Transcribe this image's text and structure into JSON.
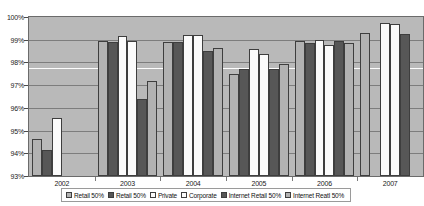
{
  "chart_data": {
    "type": "bar",
    "title": "",
    "xlabel": "",
    "ylabel": "",
    "categories": [
      "2002",
      "2003",
      "2004",
      "2005",
      "2006",
      "2007"
    ],
    "ylim": [
      93,
      100
    ],
    "ytick_labels": [
      "100%",
      "99%",
      "98%",
      "97%",
      "96%",
      "95%",
      "94%",
      "93%"
    ],
    "ytick_values": [
      100,
      99,
      98,
      97,
      96,
      95,
      94,
      93
    ],
    "grid": true,
    "legend_position": "bottom",
    "series": [
      {
        "name": "Retail 50%",
        "fill": "lightgray",
        "values": [
          94.65,
          98.95,
          98.9,
          97.5,
          98.95,
          99.3
        ]
      },
      {
        "name": "Retail 50%",
        "fill": "darkgray",
        "values": [
          94.15,
          98.9,
          98.9,
          97.7,
          98.85,
          null
        ]
      },
      {
        "name": "Private",
        "fill": "white",
        "values": [
          95.55,
          99.15,
          99.2,
          98.6,
          99.0,
          99.75
        ]
      },
      {
        "name": "Corporate",
        "fill": "white",
        "values": [
          null,
          98.95,
          99.2,
          98.35,
          98.75,
          99.7
        ]
      },
      {
        "name": "Internet Retail 50%",
        "fill": "darkgray",
        "values": [
          null,
          96.4,
          98.5,
          97.7,
          98.95,
          99.25
        ]
      },
      {
        "name": "Internet Reatl 50%",
        "fill": "lightgray",
        "values": [
          null,
          97.2,
          98.65,
          97.95,
          98.85,
          null
        ]
      }
    ],
    "colors": {
      "lightgray": "#b2b2b2",
      "darkgray": "#575757",
      "white": "#fbfbfb",
      "plot_background": "#b9b9b9",
      "gridline": "#7d7d7d",
      "trendline": "#fdfdfd",
      "bar_border": "#3e3e3e"
    },
    "annotations": [
      {
        "name": "trend-line",
        "type": "line",
        "value": 97.75
      }
    ]
  }
}
